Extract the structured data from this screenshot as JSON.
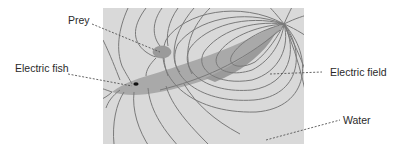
{
  "figure": {
    "labels": {
      "prey": "Prey",
      "electric_fish": "Electric fish",
      "electric_field": "Electric field",
      "water": "Water"
    }
  },
  "colors": {
    "water": "#d9d9d9",
    "fish": "#a9a9a9",
    "field_lines": "#7a7a7a",
    "prey": "#9a9a9a",
    "text": "#2a2a2a"
  }
}
